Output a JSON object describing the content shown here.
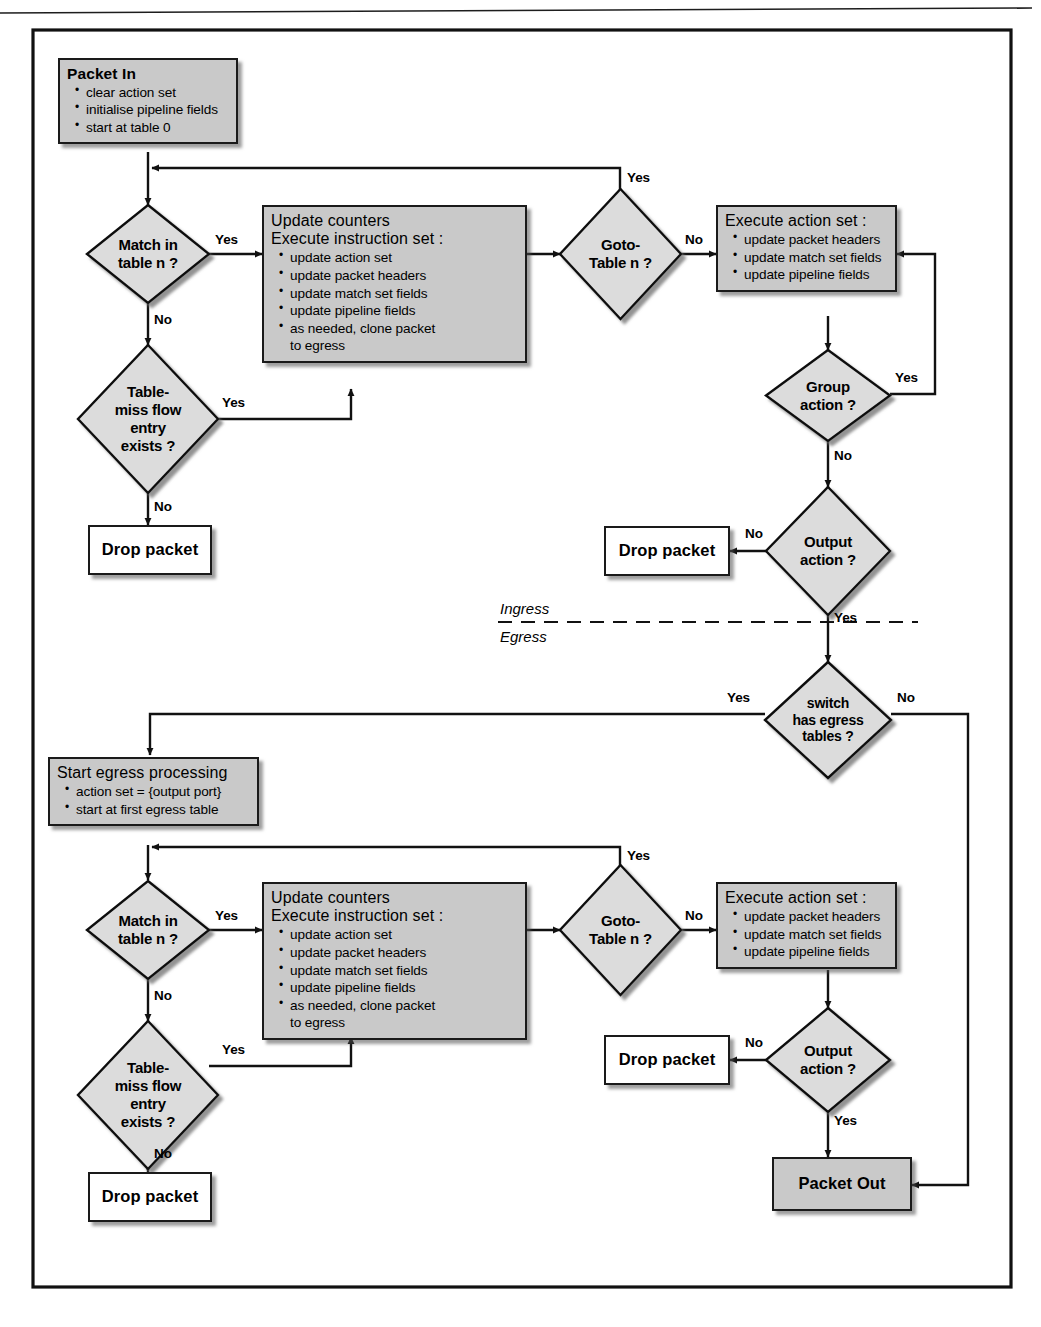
{
  "figure": {
    "frame_border_color": "#111111",
    "node_fill": "#c9c9c9",
    "diamond_fill": "#dcdcdc",
    "terminal_fill": "#ffffff",
    "separator": {
      "above_label": "Ingress",
      "below_label": "Egress",
      "style": "dashed"
    }
  },
  "labels": {
    "yes": "Yes",
    "no": "No"
  },
  "ingress": {
    "packet_in": {
      "title": "Packet In",
      "items": [
        "clear action set",
        "initialise pipeline fields",
        "start at table 0"
      ]
    },
    "match_in_table": {
      "lines": [
        "Match in",
        "table n ?"
      ]
    },
    "table_miss": {
      "lines": [
        "Table-",
        "miss flow",
        "entry",
        "exists ?"
      ]
    },
    "drop_packet_miss": {
      "title": "Drop packet"
    },
    "update_counters": {
      "title_line1": "Update counters",
      "title_line2": "Execute instruction set :",
      "items": [
        "update action set",
        "update packet headers",
        "update match set fields",
        "update pipeline fields",
        "as needed, clone packet",
        "to egress"
      ]
    },
    "goto_table": {
      "lines": [
        "Goto-",
        "Table n ?"
      ]
    },
    "execute_action_set": {
      "title": "Execute action set :",
      "items": [
        "update packet headers",
        "update match set fields",
        "update pipeline fields"
      ]
    },
    "group_action": {
      "lines": [
        "Group",
        "action ?"
      ]
    },
    "output_action": {
      "lines": [
        "Output",
        "action ?"
      ]
    },
    "drop_packet_output": {
      "title": "Drop packet"
    }
  },
  "switch_has_egress": {
    "lines": [
      "switch",
      "has egress",
      "tables ?"
    ]
  },
  "egress": {
    "start_egress": {
      "title": "Start egress processing",
      "items": [
        "action set = {output port}",
        "start at first egress table"
      ]
    },
    "match_in_table": {
      "lines": [
        "Match in",
        "table n ?"
      ]
    },
    "table_miss": {
      "lines": [
        "Table-",
        "miss flow",
        "entry",
        "exists ?"
      ]
    },
    "drop_packet_miss": {
      "title": "Drop packet"
    },
    "update_counters": {
      "title_line1": "Update counters",
      "title_line2": "Execute instruction set :",
      "items": [
        "update action set",
        "update packet headers",
        "update match set fields",
        "update pipeline fields",
        "as needed, clone packet",
        "to egress"
      ]
    },
    "goto_table": {
      "lines": [
        "Goto-",
        "Table n ?"
      ]
    },
    "execute_action_set": {
      "title": "Execute action set :",
      "items": [
        "update packet headers",
        "update match set fields",
        "update pipeline fields"
      ]
    },
    "output_action": {
      "lines": [
        "Output",
        "action ?"
      ]
    },
    "drop_packet_output": {
      "title": "Drop packet"
    },
    "packet_out": {
      "title": "Packet Out"
    }
  },
  "edge_labels": {
    "ing_match_yes": "Yes",
    "ing_match_no": "No",
    "ing_miss_yes": "Yes",
    "ing_miss_no": "No",
    "ing_goto_yes": "Yes",
    "ing_goto_no": "No",
    "ing_group_yes": "Yes",
    "ing_group_no": "No",
    "ing_output_no": "No",
    "ing_output_yes": "Yes",
    "egr_switch_yes": "Yes",
    "egr_switch_no": "No",
    "egr_match_yes": "Yes",
    "egr_match_no": "No",
    "egr_miss_yes": "Yes",
    "egr_miss_no": "No",
    "egr_goto_yes": "Yes",
    "egr_goto_no": "No",
    "egr_output_no": "No",
    "egr_output_yes": "Yes"
  }
}
